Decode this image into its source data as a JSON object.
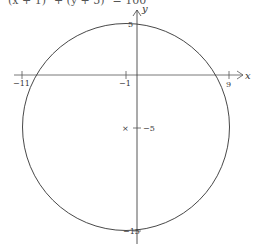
{
  "equation_fragment": "(x + 1)² + (y + 5)² = 100",
  "axes": {
    "x_label": "x",
    "y_label": "y",
    "x_ticks": [
      "−11",
      "−1",
      "9"
    ],
    "y_ticks": [
      "5",
      "−5",
      "−15"
    ]
  },
  "circle": {
    "center": [
      -1,
      -5
    ],
    "radius": 10,
    "center_marker": "×",
    "center_label": "−5"
  },
  "colors": {
    "stroke": "#333333",
    "axis": "#555555",
    "background": "#ffffff"
  }
}
